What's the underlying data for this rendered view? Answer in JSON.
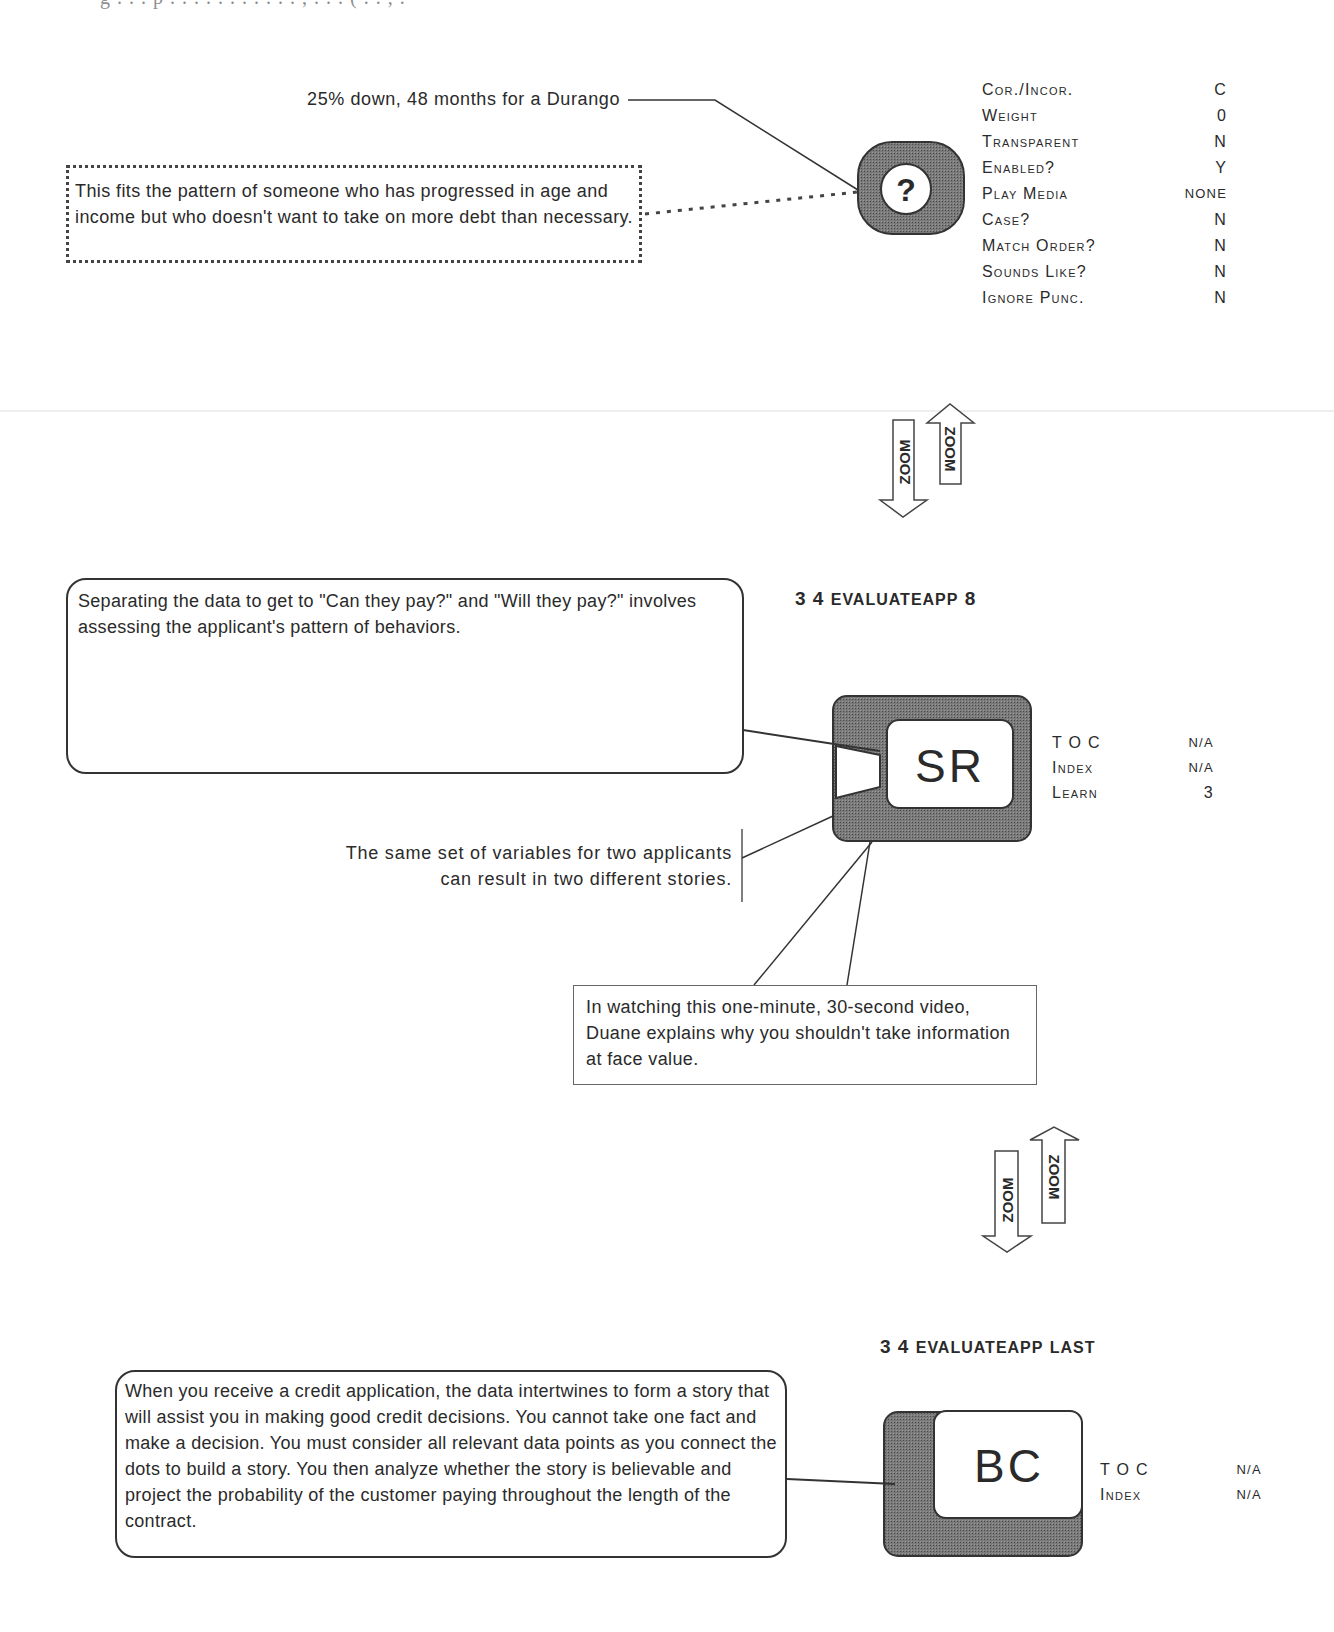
{
  "top_clipped_text": "g . . . p . . . . . . . . . . . , . . . ( . . , .",
  "frame_question": {
    "callout_solid": "25% down, 48 months for a Durango",
    "callout_dotted": "This fits the pattern of someone who has progressed in age and income but who doesn't want to take on more debt than necessary.",
    "button_glyph": "?",
    "properties": [
      {
        "key": "Cor./Incor.",
        "value": "C"
      },
      {
        "key": "Weight",
        "value": "0"
      },
      {
        "key": "Transparent",
        "value": "N"
      },
      {
        "key": "Enabled?",
        "value": "Y"
      },
      {
        "key": "Play Media",
        "value": "NONE"
      },
      {
        "key": "Case?",
        "value": "N"
      },
      {
        "key": "Match Order?",
        "value": "N"
      },
      {
        "key": "Sounds Like?",
        "value": "N"
      },
      {
        "key": "Ignore Punc.",
        "value": "N"
      }
    ]
  },
  "zoom_arrows": {
    "down_label": "ZOOM",
    "up_label": "ZOOM"
  },
  "frame_sr": {
    "heading_num": "3 4",
    "heading_name": "EvaluateApp",
    "heading_suffix": "8",
    "callout_main": "Separating the data to get to \"Can they pay?\" and \"Will they pay?\" involves assessing the applicant's pattern of behaviors.",
    "callout_side_line1": "The same set of variables for two applicants",
    "callout_side_line2": "can result in two different stories.",
    "callout_video": "In watching this one-minute, 30-second video, Duane explains why you shouldn't take information at face value.",
    "screen_label": "SR",
    "properties": [
      {
        "key": "T O C",
        "value": "N/A"
      },
      {
        "key": "Index",
        "value": "N/A"
      },
      {
        "key": "Learn",
        "value": "3"
      }
    ]
  },
  "frame_bc": {
    "heading_num": "3 4",
    "heading_name": "EvaluateApp",
    "heading_suffix": "Last",
    "callout_main": "When you receive a credit application, the data intertwines to form a story that will assist you in making good credit decisions. You cannot take one fact and make a decision. You must consider all relevant data points as you connect the dots to build a story. You then analyze whether the story is believable and project the probability of the customer paying throughout the length of the contract.",
    "screen_label": "BC",
    "properties": [
      {
        "key": "T O C",
        "value": "N/A"
      },
      {
        "key": "Index",
        "value": "N/A"
      }
    ]
  },
  "colors": {
    "ink": "#2a2a2a",
    "frame_fill": "#6e6e6e",
    "screen_fill": "#ffffff"
  }
}
